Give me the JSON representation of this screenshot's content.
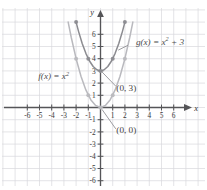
{
  "figure": {
    "background": "#ffffff"
  },
  "chart_data": {
    "type": "line",
    "title": "",
    "xlabel": "x",
    "ylabel": "y",
    "xlim": [
      -7,
      7
    ],
    "ylim": [
      -7,
      7
    ],
    "grid": true,
    "grid_color": "#d8d8dc",
    "axis_color": "#555558",
    "legend": "inline-annotations",
    "x_ticks": [
      -6,
      -5,
      -4,
      -3,
      -2,
      -1,
      1,
      2,
      3,
      4,
      5,
      6
    ],
    "x_tick_labels": [
      "-6",
      "-5",
      "-4",
      "-3",
      "-2",
      "-1",
      "1",
      "2",
      "3",
      "4",
      "5",
      "6"
    ],
    "y_ticks": [
      6,
      5,
      4,
      3,
      2,
      1,
      -1,
      -2,
      -3,
      -4,
      -5,
      -6
    ],
    "y_tick_labels": [
      "6",
      "5",
      "4",
      "3",
      "2",
      "1",
      "-1",
      "-2",
      "-3",
      "-4",
      "-5",
      "-6"
    ],
    "series": [
      {
        "name": "f(x) = x^2",
        "label_text": "f(x) = x",
        "label_exponent": "2",
        "label_tail": "",
        "color": "#b9b9be",
        "equation": "y = x^2",
        "vertex": [
          0,
          0
        ],
        "marked_points": [
          {
            "x": -2,
            "y": 4
          },
          {
            "x": -1,
            "y": 1
          },
          {
            "x": 0,
            "y": 0
          },
          {
            "x": 1,
            "y": 1
          },
          {
            "x": 2,
            "y": 4
          }
        ],
        "points": [
          {
            "x": -2.65,
            "y": 7.0
          },
          {
            "x": -2.4,
            "y": 5.76
          },
          {
            "x": -2.0,
            "y": 4.0
          },
          {
            "x": -1.6,
            "y": 2.56
          },
          {
            "x": -1.2,
            "y": 1.44
          },
          {
            "x": -0.8,
            "y": 0.64
          },
          {
            "x": -0.4,
            "y": 0.16
          },
          {
            "x": 0.0,
            "y": 0.0
          },
          {
            "x": 0.4,
            "y": 0.16
          },
          {
            "x": 0.8,
            "y": 0.64
          },
          {
            "x": 1.2,
            "y": 1.44
          },
          {
            "x": 1.6,
            "y": 2.56
          },
          {
            "x": 2.0,
            "y": 4.0
          },
          {
            "x": 2.4,
            "y": 5.76
          },
          {
            "x": 2.65,
            "y": 7.0
          }
        ]
      },
      {
        "name": "g(x) = x^2 + 3",
        "label_text": "g(x) = x",
        "label_exponent": "2",
        "label_tail": " + 3",
        "color": "#8b8b90",
        "equation": "y = x^2 + 3",
        "vertex": [
          0,
          3
        ],
        "marked_points": [
          {
            "x": -2,
            "y": 7
          },
          {
            "x": -1,
            "y": 4
          },
          {
            "x": 0,
            "y": 3
          },
          {
            "x": 1,
            "y": 4
          },
          {
            "x": 2,
            "y": 7
          }
        ],
        "points": [
          {
            "x": -2.0,
            "y": 7.0
          },
          {
            "x": -1.8,
            "y": 6.24
          },
          {
            "x": -1.5,
            "y": 5.25
          },
          {
            "x": -1.2,
            "y": 4.44
          },
          {
            "x": -0.9,
            "y": 3.81
          },
          {
            "x": -0.6,
            "y": 3.36
          },
          {
            "x": -0.3,
            "y": 3.09
          },
          {
            "x": 0.0,
            "y": 3.0
          },
          {
            "x": 0.3,
            "y": 3.09
          },
          {
            "x": 0.6,
            "y": 3.36
          },
          {
            "x": 0.9,
            "y": 3.81
          },
          {
            "x": 1.2,
            "y": 4.44
          },
          {
            "x": 1.5,
            "y": 5.25
          },
          {
            "x": 1.8,
            "y": 6.24
          },
          {
            "x": 2.0,
            "y": 7.0
          }
        ]
      }
    ],
    "annotations": [
      {
        "name": "g-function-label",
        "text": "g(x) = x",
        "exponent": "2",
        "tail": " + 3",
        "anchor": [
          2.9,
          5.15
        ],
        "leader_from": [
          2.25,
          5.1
        ],
        "leader_to": [
          1.45,
          4.7
        ]
      },
      {
        "name": "f-function-label",
        "text": "f(x) = x",
        "exponent": "2",
        "tail": "",
        "anchor": [
          -5.1,
          2.3
        ],
        "leader_from": null,
        "leader_to": null
      },
      {
        "name": "y-intercept-g-label",
        "text": "(0, 3)",
        "anchor": [
          1.3,
          1.35
        ],
        "leader_from": [
          1.25,
          1.75
        ],
        "leader_to": [
          0.12,
          2.92
        ]
      },
      {
        "name": "y-intercept-f-label",
        "text": "(0, 0)",
        "anchor": [
          1.3,
          -2.1
        ],
        "leader_from": [
          1.25,
          -1.75
        ],
        "leader_to": [
          0.12,
          -0.15
        ]
      }
    ]
  },
  "axis_labels": {
    "x": "x",
    "y": "y"
  }
}
